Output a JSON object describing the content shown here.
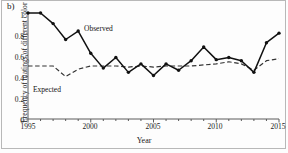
{
  "figure": {
    "panel_label": "b)",
    "background_color": "#fdfdfd",
    "frame_color": "#b8b8b8"
  },
  "chart_data": {
    "type": "line",
    "title": "",
    "subtitle": "",
    "xlabel": "Year",
    "ylabel": "Frequency of matings of different color",
    "xlim": [
      1995,
      2015
    ],
    "ylim": [
      0,
      1
    ],
    "xticks": [
      1995,
      2000,
      2005,
      2010,
      2015
    ],
    "xtick_labels": [
      "1995",
      "2000",
      "2005",
      "2010",
      "2015"
    ],
    "yticks": [
      0,
      0.2,
      0.4,
      0.6,
      0.8,
      1
    ],
    "ytick_labels": [
      "0",
      "0.2",
      "0.4",
      "0.6",
      "0.8",
      "1"
    ],
    "grid": false,
    "legend_position": "inline-annotation",
    "x": [
      1995,
      1996,
      1997,
      1998,
      1999,
      2000,
      2001,
      2002,
      2003,
      2004,
      2005,
      2006,
      2007,
      2008,
      2009,
      2010,
      2011,
      2012,
      2013,
      2014,
      2015
    ],
    "series": [
      {
        "name": "Observed",
        "style": "solid",
        "marker": "filled-circle",
        "color": "#111111",
        "values": [
          1.0,
          1.0,
          0.9,
          0.75,
          0.83,
          0.62,
          0.48,
          0.58,
          0.44,
          0.52,
          0.41,
          0.52,
          0.46,
          0.55,
          0.68,
          0.56,
          0.58,
          0.55,
          0.44,
          0.72,
          0.81
        ]
      },
      {
        "name": "Expected",
        "style": "dashed",
        "marker": "none",
        "color": "#333333",
        "values": [
          0.5,
          0.5,
          0.5,
          0.4,
          0.47,
          0.5,
          0.5,
          0.5,
          0.49,
          0.5,
          0.49,
          0.5,
          0.5,
          0.5,
          0.51,
          0.52,
          0.54,
          0.52,
          0.46,
          0.55,
          0.57
        ]
      }
    ],
    "annotations": [
      {
        "text": "Observed",
        "x": 2002,
        "y": 0.9
      },
      {
        "text": "Expected",
        "x": 1997,
        "y": 0.33
      }
    ]
  }
}
